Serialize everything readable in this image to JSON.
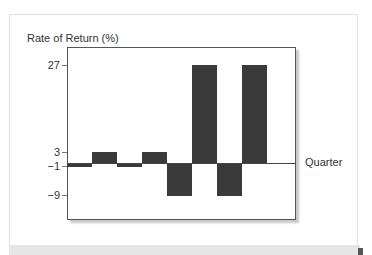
{
  "chart_data": {
    "type": "bar",
    "title": "",
    "ylabel": "Rate of Return (%)",
    "xlabel": "Quarter",
    "categories": [
      "1",
      "2",
      "3",
      "4",
      "5",
      "6",
      "7",
      "8"
    ],
    "values": [
      -1,
      3,
      -1,
      3,
      -9,
      27,
      -9,
      27
    ],
    "yticks": [
      27,
      3,
      -1,
      -9
    ],
    "ylim": [
      -13,
      32
    ],
    "grid": false,
    "legend": null,
    "bar_color": "#3a3a3a"
  },
  "labels": {
    "ylabel": "Rate of Return (%)",
    "xlabel": "Quarter",
    "ticks": [
      "27",
      "3",
      "−1",
      "−9"
    ]
  }
}
